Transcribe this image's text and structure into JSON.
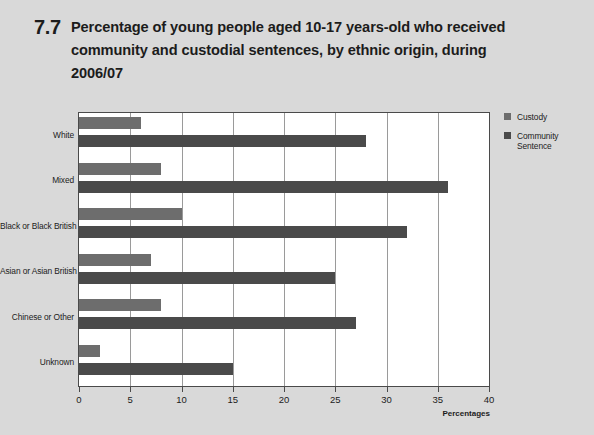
{
  "title": {
    "number": "7.7",
    "text": "Percentage of young people aged 10-17 years-old who received community and custodial sentences, by ethnic origin, during 2006/07"
  },
  "chart_data": {
    "type": "bar",
    "orientation": "horizontal",
    "title": "Percentage of young people aged 10-17 years-old who received community and custodial sentences, by ethnic origin, during 2006/07",
    "categories": [
      "White",
      "Mixed",
      "Black or Black British",
      "Asian or Asian British",
      "Chinese or Other",
      "Unknown"
    ],
    "series": [
      {
        "name": "Custody",
        "color": "#6d6d6d",
        "values": [
          6,
          8,
          10,
          7,
          8,
          2
        ]
      },
      {
        "name": "Community Sentence",
        "color": "#4a4a4a",
        "values": [
          28,
          36,
          32,
          25,
          27,
          15
        ]
      }
    ],
    "xlabel": "Percentages",
    "ylabel": "",
    "xlim": [
      0,
      40
    ],
    "xticks": [
      0,
      5,
      10,
      15,
      20,
      25,
      30,
      35,
      40
    ],
    "grid": true,
    "legend_position": "right"
  },
  "legend": {
    "items": [
      {
        "label": "Custody",
        "color": "#6d6d6d"
      },
      {
        "label": "Community Sentence",
        "color": "#4a4a4a"
      }
    ]
  },
  "colors": {
    "page_background": "#d9d9d9",
    "plot_background": "#ffffff",
    "frame": "#4a4a4a",
    "gridline": "#9a9a9a",
    "custody": "#6d6d6d",
    "community": "#4a4a4a"
  }
}
